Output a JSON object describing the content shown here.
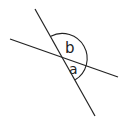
{
  "diagram": {
    "type": "intersecting-lines-angles",
    "line_color": "#222222",
    "background": "#ffffff",
    "lines": [
      {
        "id": "line-steep",
        "x1": 35,
        "y1": 9,
        "x2": 95,
        "y2": 116
      },
      {
        "id": "line-shallow",
        "x1": 10,
        "y1": 39,
        "x2": 118,
        "y2": 77
      }
    ],
    "intersection": {
      "x": 63,
      "y": 58
    },
    "arc": {
      "radius": 25
    },
    "labels": {
      "angle_b": "b",
      "angle_a": "a"
    }
  }
}
